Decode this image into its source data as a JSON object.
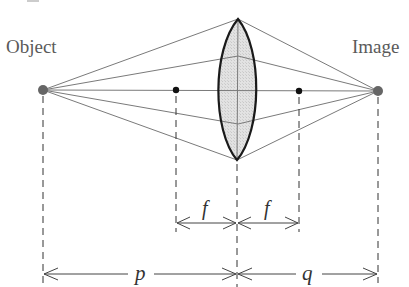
{
  "diagram": {
    "type": "thin-lens-ray-diagram",
    "labels": {
      "object": "Object",
      "image": "Image"
    },
    "dimensions": {
      "focal_left": "f",
      "focal_right": "f",
      "object_distance": "p",
      "image_distance": "q"
    },
    "points": {
      "object": {
        "x": 43,
        "y": 90
      },
      "image": {
        "x": 378,
        "y": 91
      },
      "focal_left": {
        "x": 176,
        "y": 90
      },
      "focal_right": {
        "x": 299,
        "y": 91
      },
      "lens_center_x": 238,
      "lens_top_y": 19,
      "lens_bottom_y": 160
    },
    "colors": {
      "ray": "#7a7a7a",
      "lens_fill": "#dcdcdc",
      "lens_outline": "#1a1a1a",
      "dot": "#666666",
      "focal_dot": "#111111",
      "dash": "#333333"
    }
  }
}
